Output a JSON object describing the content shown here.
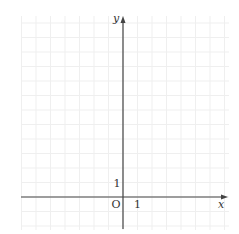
{
  "chart_data": {
    "type": "scatter",
    "title": "",
    "xlabel": "x",
    "ylabel": "y",
    "origin_label": "O",
    "x_tick_label": "1",
    "y_tick_label": "1",
    "xlim": [
      -7,
      7
    ],
    "ylim": [
      -2,
      12
    ],
    "grid": true,
    "series": []
  },
  "geometry": {
    "origin_x": 123,
    "origin_y": 197,
    "unit": 14.5,
    "grid_left": 21,
    "grid_right": 229,
    "grid_top": 16,
    "grid_bottom": 230,
    "axis_x_start": 21,
    "axis_x_end": 228,
    "axis_y_start": 229,
    "axis_y_end": 16
  },
  "colors": {
    "grid": "#efefef",
    "axis": "#444444",
    "text": "#333333"
  }
}
